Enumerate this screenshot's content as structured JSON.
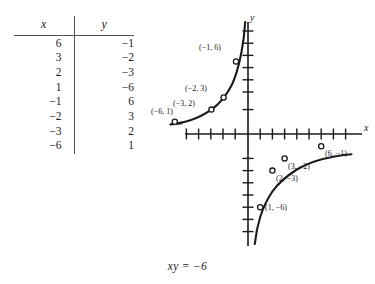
{
  "figure": {
    "caption": "xy = −6",
    "equation": "xy = -6"
  },
  "table": {
    "headers": [
      "x",
      "y"
    ],
    "rows": [
      [
        "6",
        "−1"
      ],
      [
        "3",
        "−2"
      ],
      [
        "2",
        "−3"
      ],
      [
        "1",
        "−6"
      ],
      [
        "−1",
        "6"
      ],
      [
        "−2",
        "3"
      ],
      [
        "−3",
        "2"
      ],
      [
        "−6",
        "1"
      ]
    ]
  },
  "graph": {
    "x_axis_label": "x",
    "y_axis_label": "y",
    "point_labels": [
      "(−1, 6)",
      "(−2, 3)",
      "(−3, 2)",
      "(−6, 1)",
      "(6, −1)",
      "(3, −2)",
      "(2, −3)",
      "(1, −6)"
    ]
  },
  "chart_data": {
    "type": "line",
    "title": "xy = −6",
    "xlabel": "x",
    "ylabel": "y",
    "grid": false,
    "legend": null,
    "xlim": [
      -8,
      8
    ],
    "ylim": [
      -8,
      8
    ],
    "xticks": [
      -7,
      -6,
      -5,
      -4,
      -3,
      -2,
      -1,
      1,
      2,
      3,
      4,
      5,
      6,
      7
    ],
    "yticks": [
      -7,
      -6,
      -5,
      -4,
      -3,
      -2,
      -1,
      1,
      2,
      3,
      4,
      5,
      6,
      7
    ],
    "series": [
      {
        "name": "xy = -6 (left branch)",
        "x": [
          -6,
          -3,
          -2,
          -1
        ],
        "y": [
          1,
          2,
          3,
          6
        ],
        "labels": [
          "(−6, 1)",
          "(−3, 2)",
          "(−2, 3)",
          "(−1, 6)"
        ]
      },
      {
        "name": "xy = -6 (right branch)",
        "x": [
          1,
          2,
          3,
          6
        ],
        "y": [
          -6,
          -3,
          -2,
          -1
        ],
        "labels": [
          "(1, −6)",
          "(2, −3)",
          "(3, −2)",
          "(6, −1)"
        ]
      }
    ]
  }
}
